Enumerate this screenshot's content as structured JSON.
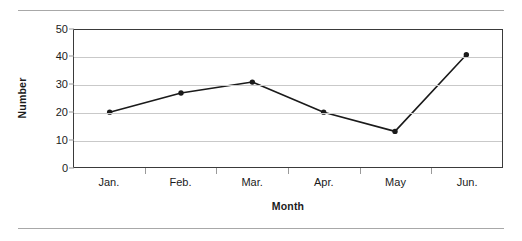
{
  "chart_data": {
    "type": "line",
    "title": "",
    "xlabel": "Month",
    "ylabel": "Number",
    "categories": [
      "Jan.",
      "Feb.",
      "Mar.",
      "Apr.",
      "May",
      "Jun."
    ],
    "values": [
      20,
      27,
      31,
      20,
      13,
      41
    ],
    "series": [
      {
        "name": "Number",
        "values": [
          20,
          27,
          31,
          20,
          13,
          41
        ]
      }
    ],
    "ylim": [
      0,
      50
    ],
    "y_ticks": [
      0,
      10,
      20,
      30,
      40,
      50
    ],
    "y_tick_labels": [
      "0",
      "10",
      "20",
      "30",
      "40",
      "50"
    ],
    "grid": "horizontal",
    "legend": "none",
    "marker": "filled-circle",
    "line_color": "#1a1a1a",
    "marker_color": "#1a1a1a",
    "gridline_color": "#c9c9c9",
    "axis_color": "#3a3a3a",
    "text_color": "#1b1b1b"
  },
  "page": {
    "background": "#ffffff",
    "rule_color": "#a8a8a8"
  }
}
